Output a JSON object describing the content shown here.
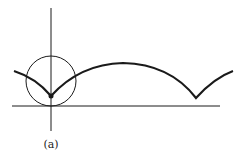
{
  "figure": {
    "label": "(a)",
    "colors": {
      "stroke": "#1a1a1a",
      "background": "#ffffff"
    }
  }
}
